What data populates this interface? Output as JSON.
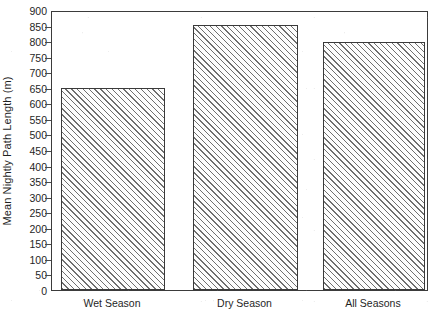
{
  "chart_data": {
    "type": "bar",
    "title": "",
    "xlabel": "",
    "ylabel": "Mean Nightly Path Length (m)",
    "categories": [
      "Wet Season",
      "Dry Season",
      "All Seasons"
    ],
    "values": [
      650,
      852,
      798
    ],
    "ylim": [
      0,
      900
    ],
    "ytick_step": 50,
    "yticks": [
      0,
      50,
      100,
      150,
      200,
      250,
      300,
      350,
      400,
      450,
      500,
      550,
      600,
      650,
      700,
      750,
      800,
      850,
      900
    ],
    "ytick_labels": [
      "0",
      "50",
      "100",
      "150",
      "200",
      "250",
      "300",
      "350",
      "400",
      "450",
      "500",
      "550",
      "600",
      "650",
      "700",
      "750",
      "800",
      "850",
      "900"
    ],
    "grid": false,
    "legend": null,
    "legend_position": "none",
    "bar_fill": "diagonal-hatch",
    "bar_edge_color": "#3a3a3a",
    "bar_hatch_color": "#6f6f6f",
    "background_color": "#ffffff",
    "frame": true,
    "series": [
      {
        "name": "Mean Nightly Path Length (m)",
        "values": [
          650,
          852,
          798
        ]
      }
    ]
  }
}
